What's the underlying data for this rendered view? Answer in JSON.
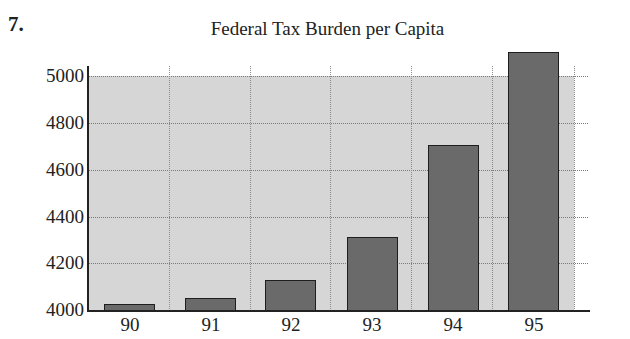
{
  "problem_number": "7.",
  "chart_data": {
    "type": "bar",
    "title": "Federal Tax Burden per Capita",
    "xlabel": "",
    "ylabel": "",
    "categories": [
      "90",
      "91",
      "92",
      "93",
      "94",
      "95"
    ],
    "values": [
      4030,
      4055,
      4130,
      4315,
      4705,
      5100
    ],
    "ylim": [
      4000,
      5000
    ],
    "yticks": [
      "4000",
      "4200",
      "4400",
      "4600",
      "4800",
      "5000"
    ],
    "grid": true,
    "legend": null,
    "colors": {
      "bar": "#6a6a6a",
      "plot_background": "#d6d6d6",
      "bar_border": "#1e1e1e"
    }
  }
}
